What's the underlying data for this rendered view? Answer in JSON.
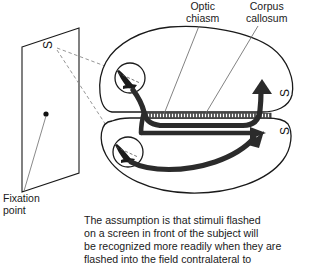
{
  "figure": {
    "title_labels": {
      "optic_chiasm": "Optic\nchiasm",
      "corpus_callosum": "Corpus\ncallosum",
      "fixation_point": "Fixation\npoint"
    },
    "stimulus_marks": {
      "on_screen": "S",
      "upper_hemisphere": "S",
      "lower_hemisphere": "S"
    },
    "parts": {
      "screen": "projection-screen",
      "fixation_dot": "fixation-dot",
      "upper_hemisphere": "upper-hemisphere",
      "lower_hemisphere": "lower-hemisphere",
      "upper_eye": "upper-eye",
      "lower_eye": "lower-eye",
      "corpus_callosum_band": "corpus-callosum-band",
      "optic_tract_upper": "optic-tract-upper",
      "optic_tract_lower": "optic-tract-lower",
      "arrow_upper": "arrow-upper",
      "arrow_lower_a": "arrow-lower-a",
      "arrow_lower_b": "arrow-lower-b"
    },
    "colors": {
      "ink": "#1a1a1a",
      "tract": "#2b2b2b",
      "leader": "#6b6b6b",
      "background": "#ffffff"
    }
  },
  "caption": {
    "text": "The assumption is that stimuli flashed\non a screen in front of the subject will\nbe recognized more readily when they are\nflashed into the field contralateral to"
  }
}
